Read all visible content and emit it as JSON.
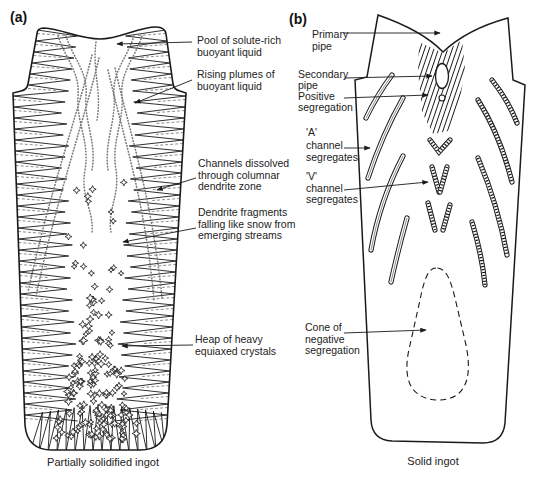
{
  "panel_a": {
    "tag": "(a)",
    "caption": "Partially solidified ingot",
    "labels": [
      {
        "lines": [
          "Pool of solute-rich",
          "buoyant liquid"
        ]
      },
      {
        "lines": [
          "Rising plumes of",
          "buoyant liquid"
        ]
      },
      {
        "lines": [
          "Channels dissolved",
          "through columnar",
          "dendrite zone"
        ]
      },
      {
        "lines": [
          "Dendrite fragments",
          "falling like snow from",
          "emerging streams"
        ]
      },
      {
        "lines": [
          "Heap of heavy",
          "equiaxed crystals"
        ]
      }
    ]
  },
  "panel_b": {
    "tag": "(b)",
    "caption": "Solid ingot",
    "labels": [
      {
        "lines": [
          "Primary",
          "pipe"
        ]
      },
      {
        "lines": [
          "Secondary",
          "pipe"
        ]
      },
      {
        "lines": [
          "Positive",
          "segregation"
        ]
      },
      {
        "lines": [
          "'A'",
          "channel",
          "segregates"
        ]
      },
      {
        "lines": [
          "'V'",
          "channel",
          "segregates"
        ]
      },
      {
        "lines": [
          "Cone of",
          "negative",
          "segregation"
        ]
      }
    ]
  },
  "colors": {
    "ink": "#1a1a1a",
    "stipple": "#7a7a7a",
    "paper": "#ffffff"
  }
}
